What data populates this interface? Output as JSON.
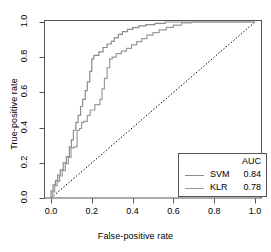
{
  "chart_data": {
    "type": "line",
    "title": "",
    "xlabel": "False-positive rate",
    "ylabel": "True-positive rate",
    "xlim": [
      0.0,
      1.0
    ],
    "ylim": [
      0.0,
      1.0
    ],
    "grid": false,
    "legend_position": "bottom-right",
    "legend_title": "AUC",
    "xticks": [
      "0.0",
      "0.2",
      "0.4",
      "0.6",
      "0.8",
      "1.0"
    ],
    "xtick_values": [
      0.0,
      0.2,
      0.4,
      0.6,
      0.8,
      1.0
    ],
    "yticks": [
      "0.0",
      "0.2",
      "0.4",
      "0.6",
      "0.8",
      "1.0"
    ],
    "ytick_values": [
      0.0,
      0.2,
      0.4,
      0.6,
      0.8,
      1.0
    ],
    "annotations": [
      {
        "name": "chance-diagonal",
        "from": [
          0.0,
          0.0
        ],
        "to": [
          1.0,
          1.0
        ],
        "style": "dotted",
        "color": "#000000"
      }
    ],
    "series": [
      {
        "name": "SVM",
        "auc": "0.84",
        "auc_value": 0.84,
        "color": "#8c8c8c",
        "step": true,
        "points": [
          [
            0.0,
            0.0
          ],
          [
            0.0,
            0.04
          ],
          [
            0.01,
            0.04
          ],
          [
            0.01,
            0.075
          ],
          [
            0.022,
            0.075
          ],
          [
            0.022,
            0.1
          ],
          [
            0.033,
            0.1
          ],
          [
            0.033,
            0.13
          ],
          [
            0.045,
            0.13
          ],
          [
            0.045,
            0.16
          ],
          [
            0.06,
            0.16
          ],
          [
            0.06,
            0.2
          ],
          [
            0.075,
            0.2
          ],
          [
            0.075,
            0.235
          ],
          [
            0.09,
            0.235
          ],
          [
            0.09,
            0.29
          ],
          [
            0.1,
            0.29
          ],
          [
            0.1,
            0.33
          ],
          [
            0.11,
            0.33
          ],
          [
            0.11,
            0.385
          ],
          [
            0.122,
            0.385
          ],
          [
            0.122,
            0.43
          ],
          [
            0.133,
            0.43
          ],
          [
            0.133,
            0.47
          ],
          [
            0.145,
            0.47
          ],
          [
            0.145,
            0.52
          ],
          [
            0.155,
            0.52
          ],
          [
            0.155,
            0.56
          ],
          [
            0.168,
            0.56
          ],
          [
            0.168,
            0.61
          ],
          [
            0.178,
            0.61
          ],
          [
            0.178,
            0.66
          ],
          [
            0.19,
            0.66
          ],
          [
            0.19,
            0.72
          ],
          [
            0.2,
            0.72
          ],
          [
            0.2,
            0.79
          ],
          [
            0.21,
            0.79
          ],
          [
            0.21,
            0.81
          ],
          [
            0.235,
            0.81
          ],
          [
            0.235,
            0.83
          ],
          [
            0.255,
            0.83
          ],
          [
            0.255,
            0.855
          ],
          [
            0.275,
            0.855
          ],
          [
            0.275,
            0.875
          ],
          [
            0.295,
            0.875
          ],
          [
            0.295,
            0.89
          ],
          [
            0.31,
            0.89
          ],
          [
            0.31,
            0.91
          ],
          [
            0.33,
            0.91
          ],
          [
            0.33,
            0.93
          ],
          [
            0.35,
            0.93
          ],
          [
            0.35,
            0.945
          ],
          [
            0.375,
            0.945
          ],
          [
            0.375,
            0.958
          ],
          [
            0.4,
            0.958
          ],
          [
            0.4,
            0.968
          ],
          [
            0.43,
            0.968
          ],
          [
            0.43,
            0.978
          ],
          [
            0.465,
            0.978
          ],
          [
            0.465,
            0.985
          ],
          [
            0.51,
            0.985
          ],
          [
            0.51,
            0.992
          ],
          [
            0.56,
            0.992
          ],
          [
            0.56,
            1.0
          ],
          [
            1.0,
            1.0
          ]
        ]
      },
      {
        "name": "KLR",
        "auc": "0.78",
        "auc_value": 0.78,
        "color": "#9a9a9a",
        "step": true,
        "points": [
          [
            0.0,
            0.0
          ],
          [
            0.008,
            0.0
          ],
          [
            0.008,
            0.035
          ],
          [
            0.018,
            0.035
          ],
          [
            0.018,
            0.07
          ],
          [
            0.03,
            0.07
          ],
          [
            0.03,
            0.095
          ],
          [
            0.042,
            0.095
          ],
          [
            0.042,
            0.125
          ],
          [
            0.055,
            0.125
          ],
          [
            0.055,
            0.155
          ],
          [
            0.07,
            0.155
          ],
          [
            0.07,
            0.195
          ],
          [
            0.085,
            0.195
          ],
          [
            0.085,
            0.23
          ],
          [
            0.098,
            0.23
          ],
          [
            0.098,
            0.285
          ],
          [
            0.112,
            0.285
          ],
          [
            0.112,
            0.29
          ],
          [
            0.128,
            0.29
          ],
          [
            0.128,
            0.385
          ],
          [
            0.14,
            0.385
          ],
          [
            0.14,
            0.395
          ],
          [
            0.15,
            0.395
          ],
          [
            0.15,
            0.43
          ],
          [
            0.162,
            0.43
          ],
          [
            0.162,
            0.435
          ],
          [
            0.178,
            0.435
          ],
          [
            0.178,
            0.47
          ],
          [
            0.192,
            0.47
          ],
          [
            0.192,
            0.5
          ],
          [
            0.215,
            0.5
          ],
          [
            0.215,
            0.53
          ],
          [
            0.24,
            0.53
          ],
          [
            0.24,
            0.56
          ],
          [
            0.25,
            0.56
          ],
          [
            0.25,
            0.62
          ],
          [
            0.262,
            0.62
          ],
          [
            0.262,
            0.68
          ],
          [
            0.275,
            0.68
          ],
          [
            0.275,
            0.74
          ],
          [
            0.288,
            0.74
          ],
          [
            0.288,
            0.79
          ],
          [
            0.3,
            0.79
          ],
          [
            0.3,
            0.8
          ],
          [
            0.32,
            0.8
          ],
          [
            0.32,
            0.82
          ],
          [
            0.345,
            0.82
          ],
          [
            0.345,
            0.835
          ],
          [
            0.37,
            0.835
          ],
          [
            0.37,
            0.85
          ],
          [
            0.395,
            0.85
          ],
          [
            0.395,
            0.87
          ],
          [
            0.42,
            0.87
          ],
          [
            0.42,
            0.888
          ],
          [
            0.445,
            0.888
          ],
          [
            0.445,
            0.905
          ],
          [
            0.47,
            0.905
          ],
          [
            0.47,
            0.925
          ],
          [
            0.5,
            0.925
          ],
          [
            0.5,
            0.94
          ],
          [
            0.53,
            0.94
          ],
          [
            0.53,
            0.955
          ],
          [
            0.565,
            0.955
          ],
          [
            0.565,
            0.97
          ],
          [
            0.6,
            0.97
          ],
          [
            0.6,
            0.982
          ],
          [
            0.64,
            0.982
          ],
          [
            0.64,
            0.995
          ],
          [
            0.69,
            0.995
          ],
          [
            0.69,
            1.0
          ],
          [
            1.0,
            1.0
          ]
        ]
      }
    ]
  },
  "legend": {
    "title": "AUC",
    "entries": [
      {
        "label": "SVM",
        "value": "0.84"
      },
      {
        "label": "KLR",
        "value": "0.78"
      }
    ]
  },
  "axes": {
    "x": {
      "title": "False-positive rate",
      "ticks": [
        "0.0",
        "0.2",
        "0.4",
        "0.6",
        "0.8",
        "1.0"
      ]
    },
    "y": {
      "title": "True-positive rate",
      "ticks": [
        "0.0",
        "0.2",
        "0.4",
        "0.6",
        "0.8",
        "1.0"
      ]
    }
  },
  "colors": {
    "svm_line": "#8c8c8c",
    "klr_line": "#9a9a9a",
    "diagonal": "#000000",
    "frame": "#555555",
    "background": "#ffffff"
  }
}
